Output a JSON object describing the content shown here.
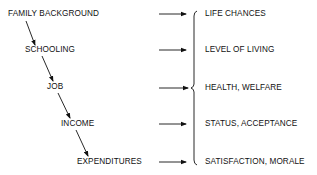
{
  "diagram": {
    "chain": [
      {
        "label": "FAMILY BACKGROUND"
      },
      {
        "label": "SCHOOLING"
      },
      {
        "label": "JOB"
      },
      {
        "label": "INCOME"
      },
      {
        "label": "EXPENDITURES"
      }
    ],
    "outcomes": [
      {
        "label": "LIFE CHANCES"
      },
      {
        "label": "LEVEL OF LIVING"
      },
      {
        "label": "HEALTH, WELFARE"
      },
      {
        "label": "STATUS, ACCEPTANCE"
      },
      {
        "label": "SATISFACTION, MORALE"
      }
    ],
    "line_color": "#111111"
  }
}
